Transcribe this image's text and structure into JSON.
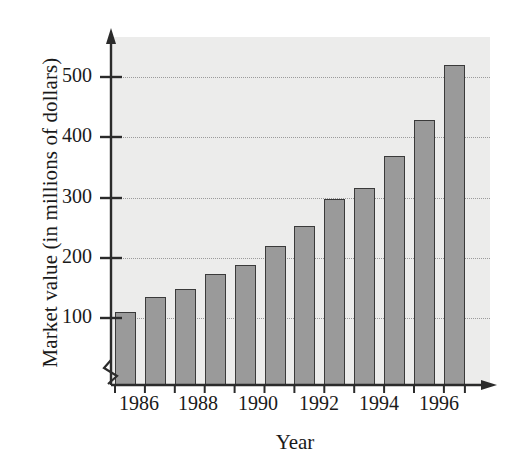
{
  "chart_data": {
    "type": "bar",
    "title": "",
    "xlabel": "Year",
    "ylabel": "Market value (in millions of dollars)",
    "categories": [
      "1986",
      "1987",
      "1988",
      "1989",
      "1990",
      "1991",
      "1992",
      "1993",
      "1994",
      "1995",
      "1996",
      "1997"
    ],
    "values": [
      110,
      135,
      148,
      173,
      188,
      220,
      253,
      298,
      315,
      368,
      428,
      520
    ],
    "x_tick_labels": [
      "1986",
      "1988",
      "1990",
      "1992",
      "1994",
      "1996"
    ],
    "x_tick_categories": [
      "1986",
      "1988",
      "1990",
      "1992",
      "1994",
      "1996"
    ],
    "y_tick_labels": [
      "100",
      "200",
      "300",
      "400",
      "500"
    ],
    "y_ticks": [
      100,
      200,
      300,
      400,
      500
    ],
    "ylim": [
      0,
      560
    ],
    "grid": "horizontal-dotted",
    "legend": "none",
    "axis_break": "y-axis zigzag near origin",
    "bar_fill_color": "#9a9a9a",
    "bar_edge_color": "#3a3a3a",
    "plot_background_color": "#ececeb",
    "gridline_color": "#9b9b9b",
    "axis_color": "#2b2b2b"
  },
  "axis_titles": {
    "y": "Market value (in millions of dollars)",
    "x": "Year"
  }
}
